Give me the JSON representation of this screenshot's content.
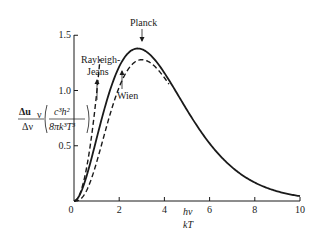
{
  "chart_data": {
    "type": "line",
    "title": "",
    "xlabel": "hν / kT",
    "ylabel": "Δu_ν / Δν · (c³h² / 8πk³T³)",
    "xlim": [
      0,
      10
    ],
    "ylim": [
      0,
      1.5
    ],
    "x_ticks": [
      "0",
      "2",
      "4",
      "6",
      "8",
      "10"
    ],
    "y_ticks": [
      "0",
      "0.5",
      "1.0",
      "1.5"
    ],
    "grid": false,
    "legend": "none (curves labeled by arrows)",
    "series": [
      {
        "name": "Planck",
        "style": "solid",
        "x": [
          0,
          0.5,
          1,
          1.5,
          2,
          2.5,
          2.82,
          3,
          4,
          5,
          6,
          7,
          8,
          9,
          10
        ],
        "values": [
          0,
          0.19,
          0.58,
          0.97,
          1.25,
          1.39,
          1.42,
          1.42,
          1.19,
          0.85,
          0.54,
          0.32,
          0.17,
          0.09,
          0.05
        ]
      },
      {
        "name": "Wien",
        "style": "dashed",
        "x": [
          0,
          0.5,
          1,
          1.5,
          2,
          2.5,
          3,
          4,
          5,
          6,
          7,
          8,
          9,
          10
        ],
        "values": [
          0,
          0.08,
          0.37,
          0.75,
          1.08,
          1.28,
          1.34,
          1.17,
          0.84,
          0.54,
          0.32,
          0.17,
          0.09,
          0.05
        ]
      },
      {
        "name": "Rayleigh-Jeans",
        "style": "dashed",
        "x": [
          0,
          0.5,
          1,
          1.15
        ],
        "values": [
          0,
          0.25,
          1.0,
          1.32
        ]
      }
    ],
    "annotations": [
      "Planck",
      "Rayleigh-Jeans",
      "Wien"
    ]
  },
  "labels": {
    "planck": "Planck",
    "rayleigh_1": "Rayleigh-",
    "rayleigh_2": "Jeans",
    "wien": "Wien",
    "y_num": "Δu",
    "y_sub": "ν",
    "y_den": "Δν",
    "y_frac_num": "c³h²",
    "y_frac_den": "8πk³T³",
    "x_num": "hν",
    "x_den": "kT"
  }
}
